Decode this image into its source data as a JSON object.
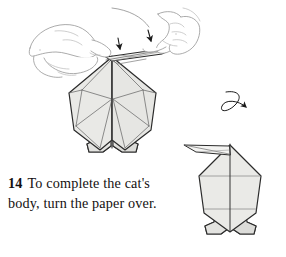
{
  "page": {
    "background_color": "#ffffff",
    "width": 286,
    "height": 257
  },
  "caption": {
    "step_number": "14",
    "text": "To complete the cat's body, turn the paper over.",
    "full_text": "14  To complete the cat's body, turn the paper over."
  },
  "illustration": {
    "title": "Origami cat body folding diagram, step 14",
    "paper_fill": "#e9e9e6",
    "paper_fill_light": "#f1f1ef",
    "paper_fill_shade": "#dddddb",
    "outline_color": "#2b2b2b",
    "crease_color": "#6d6d6d",
    "hand_line_color": "#9a9a9a",
    "arrow_color": "#1a1a1a",
    "figures": [
      {
        "name": "cat-body-front-view",
        "description": "Partially folded origami cat body held between two hands, with a thin flap pulled to the right and two downward fold arrows"
      },
      {
        "name": "cat-body-reversed-view",
        "description": "Finished reversed origami cat body with pointed tail flap projecting to the upper left"
      }
    ],
    "annotations": [
      {
        "name": "fold-arrow-left",
        "kind": "arrowhead-down"
      },
      {
        "name": "fold-arrow-right",
        "kind": "arrowhead-down"
      },
      {
        "name": "turn-over-arrow",
        "kind": "looping-arrow"
      }
    ]
  }
}
